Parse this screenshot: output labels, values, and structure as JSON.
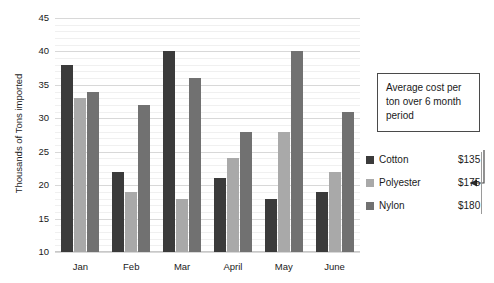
{
  "chart_data": {
    "type": "bar",
    "title": "",
    "xlabel": "",
    "ylabel": "Thousands of Tons imported",
    "ylim": [
      10,
      45
    ],
    "ytick_step": 5,
    "minor_gridlines": true,
    "grid": true,
    "legend_position": "right",
    "categories": [
      "Jan",
      "Feb",
      "Mar",
      "April",
      "May",
      "June"
    ],
    "series": [
      {
        "name": "Cotton",
        "color": "#3b3b3b",
        "values": [
          38,
          22,
          40,
          21,
          18,
          19
        ]
      },
      {
        "name": "Polyester",
        "color": "#a9a9a9",
        "values": [
          33,
          19,
          18,
          24,
          28,
          22
        ]
      },
      {
        "name": "Nylon",
        "color": "#717171",
        "values": [
          34,
          32,
          36,
          28,
          40,
          31
        ]
      }
    ],
    "yticks": [
      "45",
      "40",
      "35",
      "30",
      "25",
      "20",
      "15",
      "10"
    ],
    "annotations": [
      {
        "name": "average-cost-callout",
        "text": "Average cost per ton over 6 month period",
        "points_to": "legend-price-column"
      }
    ]
  },
  "callout": {
    "text": "Average cost per ton over 6 month period"
  },
  "legend": {
    "rows": [
      {
        "name": "Cotton",
        "price": "$135",
        "color": "#3b3b3b"
      },
      {
        "name": "Polyester",
        "price": "$175",
        "color": "#a9a9a9"
      },
      {
        "name": "Nylon",
        "price": "$180",
        "color": "#717171"
      }
    ]
  }
}
